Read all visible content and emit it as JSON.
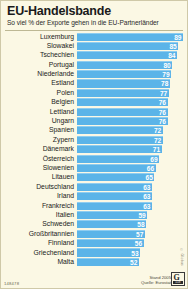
{
  "header": {
    "title": "EU-Handelsbande",
    "subtitle": "So viel % der Exporte gehen in die EU-Partnerländer"
  },
  "footer": {
    "id_code": "148478",
    "source_line1": "Stand 2005",
    "source_line2": "Quelle: Eurostat",
    "logo_letter": "G",
    "logo_tag": "118",
    "sidemark": "© Globus"
  },
  "style": {
    "background": "#fbf8e4",
    "bar_color": "#5bb4e8",
    "bar_highlight": "#8fcdf0",
    "value_color": "#ffffff",
    "text_color": "#1a1a1a"
  },
  "chart_data": {
    "type": "bar",
    "orientation": "horizontal",
    "title": "EU-Handelsbande",
    "subtitle": "So viel % der Exporte gehen in die EU-Partnerländer",
    "xlabel": "",
    "ylabel": "",
    "unit": "%",
    "xlim": [
      0,
      89
    ],
    "grid": false,
    "legend": false,
    "categories": [
      "Luxemburg",
      "Slowakei",
      "Tschechien",
      "Portugal",
      "Niederlande",
      "Estland",
      "Polen",
      "Belgien",
      "Lettland",
      "Ungarn",
      "Spanien",
      "Zypern",
      "Dänemark",
      "Österreich",
      "Slowenien",
      "Litauen",
      "Deutschland",
      "Irland",
      "Frankreich",
      "Italien",
      "Schweden",
      "Großbritannien",
      "Finnland",
      "Griechenland",
      "Malta"
    ],
    "values": [
      89,
      85,
      84,
      80,
      79,
      78,
      77,
      76,
      76,
      76,
      72,
      72,
      71,
      69,
      66,
      65,
      63,
      63,
      63,
      59,
      58,
      57,
      56,
      53,
      52
    ]
  }
}
